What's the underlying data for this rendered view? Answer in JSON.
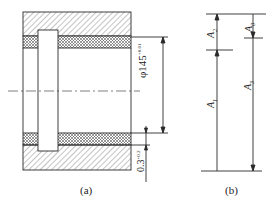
{
  "figure_a": {
    "caption": "(a)",
    "diameter_dim": {
      "symbol": "φ",
      "value": "145",
      "upper_tol": "+0.01",
      "lower_tol": "0"
    },
    "gap_dim": {
      "value": "0.3",
      "upper_tol": "+0.2",
      "lower_tol": "0"
    }
  },
  "figure_b": {
    "caption": "(b)",
    "labels": {
      "a0": "A",
      "a0_sub": "0",
      "a1": "A",
      "a1_sub": "1",
      "a2": "A",
      "a2_sub": "2",
      "a3": "A",
      "a3_sub": "3"
    }
  },
  "colors": {
    "line": "#2a2a2a",
    "background": "#ffffff"
  }
}
